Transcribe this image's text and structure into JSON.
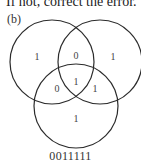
{
  "header": {
    "text": "If not, correct the error."
  },
  "figure": {
    "part_label": "(b)",
    "diagram_type": "three-set Venn diagram",
    "stroke_color": "#2b2b2b",
    "regions": {
      "left_only": "1",
      "left_right_only": "0",
      "right_only": "1",
      "left_bottom_only": "0",
      "all_three": "1",
      "right_bottom_only": "1",
      "bottom_only": "1"
    },
    "caption": "0011111"
  }
}
